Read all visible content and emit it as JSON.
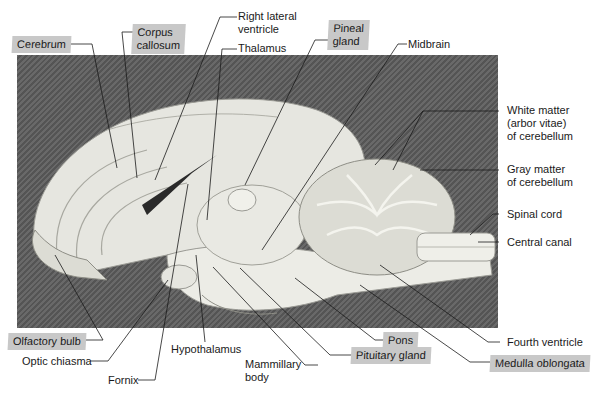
{
  "figure": {
    "highlight_color": "#c8c8c8",
    "background_color": "#5e5e5e"
  },
  "labels": {
    "cerebrum": "Cerebrum",
    "corpus_callosum_1": "Corpus",
    "corpus_callosum_2": "callosum",
    "right_lateral_ventricle_1": "Right lateral",
    "right_lateral_ventricle_2": "ventricle",
    "thalamus": "Thalamus",
    "pineal_gland_1": "Pineal",
    "pineal_gland_2": "gland",
    "midbrain": "Midbrain",
    "white_matter_1": "White matter",
    "white_matter_2": "(arbor vitae)",
    "white_matter_3": "of cerebellum",
    "gray_matter_1": "Gray matter",
    "gray_matter_2": "of cerebellum",
    "spinal_cord": "Spinal cord",
    "central_canal": "Central canal",
    "olfactory_bulb": "Olfactory bulb",
    "optic_chiasma": "Optic chiasma",
    "fornix": "Fornix",
    "hypothalamus": "Hypothalamus",
    "mammillary_body_1": "Mammillary",
    "mammillary_body_2": "body",
    "pons": "Pons",
    "pituitary_gland": "Pituitary gland",
    "fourth_ventricle": "Fourth ventricle",
    "medulla_oblongata": "Medulla oblongata"
  }
}
